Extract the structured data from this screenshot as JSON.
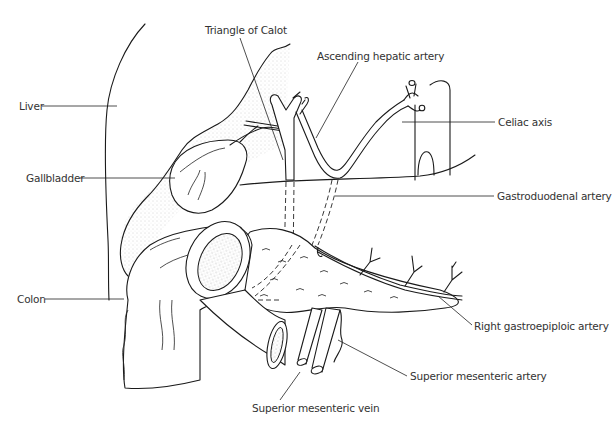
{
  "figure": {
    "type": "anatomical line drawing",
    "labels": {
      "triangle_of_calot": "Triangle of Calot",
      "ascending_hepatic_artery": "Ascending hepatic artery",
      "liver": "Liver",
      "celiac_axis": "Celiac axis",
      "gallbladder": "Gallbladder",
      "gastroduodenal_artery": "Gastroduodenal artery",
      "colon": "Colon",
      "right_gastroepiploic_artery": "Right gastroepiploic artery",
      "superior_mesenteric_artery": "Superior mesenteric artery",
      "superior_mesenteric_vein": "Superior mesenteric vein"
    },
    "colors": {
      "ink": "#1a1a1a",
      "label_text": "#333333",
      "background": "#ffffff"
    }
  }
}
